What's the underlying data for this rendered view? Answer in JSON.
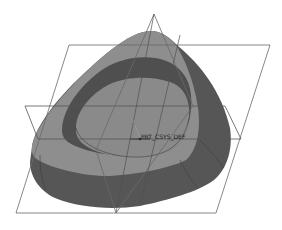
{
  "scene": {
    "description": "3D CAD model of a rounded triangular shell with inner cavity and datum planes",
    "background": "#ffffff",
    "colors": {
      "top_face": "#8e8e8e",
      "inner_wall": "#4f4f4f",
      "cavity_floor": "#8a8a8a",
      "outer_side": "#555555",
      "outer_side_right": "#4d4d4d",
      "datum_line": "#6a6a6a",
      "edge_line": "#3a3a3a"
    },
    "datum_planes": [
      {
        "name": "datum-plane-front",
        "shape": "parallelogram"
      },
      {
        "name": "datum-plane-top",
        "shape": "parallelogram"
      },
      {
        "name": "datum-plane-right",
        "shape": "triangle"
      }
    ],
    "coordinate_system": {
      "label": "PRT_CSYS_DEF"
    }
  }
}
